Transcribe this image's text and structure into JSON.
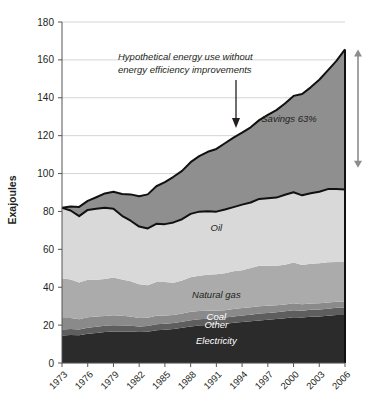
{
  "chart_data": {
    "type": "area",
    "title": "",
    "xlabel": "",
    "ylabel": "Exajoules",
    "ylim": [
      0,
      180
    ],
    "ytick_step": 20,
    "yticks": [
      "0",
      "20",
      "40",
      "60",
      "80",
      "100",
      "120",
      "140",
      "160",
      "180"
    ],
    "grid": true,
    "legend_position": "inline-band-labels",
    "x": [
      1973,
      1974,
      1975,
      1976,
      1977,
      1978,
      1979,
      1980,
      1981,
      1982,
      1983,
      1984,
      1985,
      1986,
      1987,
      1988,
      1989,
      1990,
      1991,
      1992,
      1993,
      1994,
      1995,
      1996,
      1997,
      1998,
      1999,
      2000,
      2001,
      2002,
      2003,
      2004,
      2005,
      2006
    ],
    "xticks": [
      "1973",
      "1976",
      "1979",
      "1982",
      "1985",
      "1988",
      "1991",
      "1994",
      "1997",
      "2000",
      "2003",
      "2006"
    ],
    "stack_order": [
      "Electricity",
      "Other",
      "Coal",
      "Natural gas",
      "Oil"
    ],
    "series": [
      {
        "name": "Electricity",
        "color": "#2b2b2b",
        "label_color": "on-dark",
        "values": [
          14.5,
          14.8,
          14.6,
          15.4,
          15.9,
          16.3,
          16.6,
          16.6,
          16.6,
          16.3,
          16.5,
          17.3,
          17.6,
          18.0,
          18.6,
          19.3,
          19.8,
          20.1,
          20.4,
          20.6,
          21.2,
          21.6,
          22.0,
          22.5,
          22.8,
          23.2,
          23.6,
          24.2,
          24.0,
          24.4,
          24.6,
          24.9,
          25.3,
          25.4
        ]
      },
      {
        "name": "Other",
        "color": "#5e5e5e",
        "label_color": "on-dark",
        "values": [
          3.2,
          3.2,
          3.1,
          3.2,
          3.2,
          3.3,
          3.3,
          3.2,
          3.1,
          3.0,
          3.0,
          3.1,
          3.1,
          3.1,
          3.2,
          3.3,
          3.3,
          3.3,
          3.3,
          3.4,
          3.4,
          3.5,
          3.5,
          3.6,
          3.6,
          3.6,
          3.7,
          3.7,
          3.6,
          3.7,
          3.7,
          3.8,
          3.8,
          3.9
        ]
      },
      {
        "name": "Coal",
        "color": "#8a8a8a",
        "label_color": "on-dark",
        "values": [
          6.0,
          5.8,
          5.4,
          5.5,
          5.4,
          5.2,
          5.3,
          5.1,
          4.8,
          4.5,
          4.4,
          4.5,
          4.4,
          4.3,
          4.3,
          4.4,
          4.3,
          4.2,
          4.0,
          3.9,
          3.9,
          3.9,
          3.9,
          3.9,
          3.8,
          3.7,
          3.6,
          3.6,
          3.4,
          3.3,
          3.3,
          3.3,
          3.2,
          3.2
        ]
      },
      {
        "name": "Natural gas",
        "color": "#ababab",
        "label_color": "on-light",
        "values": [
          21.0,
          20.3,
          19.4,
          19.9,
          19.5,
          19.6,
          19.9,
          19.2,
          18.6,
          17.8,
          17.1,
          17.9,
          17.6,
          17.0,
          17.4,
          18.3,
          18.7,
          19.0,
          19.2,
          19.5,
          19.9,
          20.0,
          20.7,
          21.4,
          21.2,
          20.8,
          21.0,
          21.5,
          20.7,
          21.0,
          21.1,
          21.2,
          21.0,
          20.8
        ]
      },
      {
        "name": "Oil",
        "color": "#d9d9d9",
        "label_color": "on-light",
        "values": [
          37.2,
          36.4,
          35.0,
          36.8,
          37.4,
          37.6,
          36.3,
          33.6,
          32.0,
          30.4,
          30.0,
          30.7,
          30.6,
          31.8,
          32.4,
          33.4,
          33.8,
          33.5,
          33.0,
          33.6,
          33.9,
          34.6,
          34.6,
          35.2,
          35.6,
          36.0,
          36.9,
          37.1,
          36.8,
          37.2,
          37.7,
          38.6,
          38.5,
          38.3
        ]
      }
    ],
    "total_actual": [
      81.9,
      80.5,
      77.5,
      80.8,
      81.4,
      82.0,
      81.4,
      77.7,
      75.1,
      72.0,
      71.0,
      73.5,
      73.3,
      74.2,
      75.9,
      78.7,
      79.9,
      80.1,
      79.9,
      81.0,
      82.3,
      83.6,
      84.7,
      86.6,
      87.0,
      87.3,
      88.8,
      90.1,
      88.5,
      89.6,
      90.4,
      91.8,
      91.8,
      91.6
    ],
    "hypothetical": [
      81.9,
      82.6,
      82.4,
      85.6,
      87.5,
      89.5,
      90.4,
      89.2,
      89.0,
      88.0,
      89.0,
      93.3,
      95.5,
      98.3,
      101.4,
      106.0,
      109.2,
      111.5,
      113.0,
      116.0,
      119.0,
      121.6,
      124.4,
      128.2,
      131.0,
      133.5,
      137.0,
      141.0,
      142.0,
      145.5,
      149.5,
      154.5,
      159.5,
      165.5
    ],
    "hypothetical_label": "Hypothetical energy use without\nenergy efficiency improvements",
    "hypothetical_label_line1": "Hypothetical energy use without",
    "hypothetical_label_line2": "energy efficiency improvements",
    "savings_label": "Savings 63%",
    "savings_bracket": {
      "top": 165.5,
      "bottom": 103.0
    },
    "band_label_positions": [
      {
        "name": "Oil",
        "x": 1991,
        "y": 71
      },
      {
        "name": "Natural gas",
        "x": 1991,
        "y": 36
      },
      {
        "name": "Coal",
        "x": 1991,
        "y": 24.5
      },
      {
        "name": "Other",
        "x": 1991,
        "y": 20
      },
      {
        "name": "Electricity",
        "x": 1991,
        "y": 11.5
      }
    ],
    "colors": {
      "oil": "#d9d9d9",
      "natural_gas": "#ababab",
      "coal": "#8a8a8a",
      "other": "#5e5e5e",
      "electricity": "#2b2b2b",
      "savings_band": "#8f8f8f",
      "outline": "#111111",
      "grid": "#c9c9c9",
      "axis": "#555555",
      "arrow": "#8d8d8d"
    }
  }
}
